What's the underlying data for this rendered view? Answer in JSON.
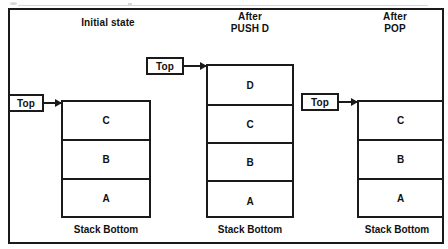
{
  "figure": {
    "outer_frame": true,
    "ink_color": "#1a1a1a",
    "background_color": "#ffffff"
  },
  "columns": [
    {
      "id": "initial",
      "caption": "Initial state",
      "pointer_label": "Top",
      "bottom_label": "Stack Bottom",
      "cells": [
        "C",
        "B",
        "A"
      ]
    },
    {
      "id": "after-push-d",
      "caption": "After\nPUSH D",
      "pointer_label": "Top",
      "bottom_label": "Stack Bottom",
      "cells": [
        "D",
        "C",
        "B",
        "A"
      ]
    },
    {
      "id": "after-pop",
      "caption": "After\nPOP",
      "pointer_label": "Top",
      "bottom_label": "Stack Bottom",
      "cells": [
        "C",
        "B",
        "A"
      ]
    }
  ]
}
